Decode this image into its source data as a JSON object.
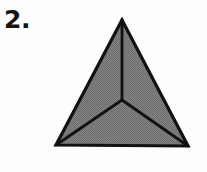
{
  "figure": {
    "label": "2.",
    "title": "",
    "background_color": "#fdfdfd",
    "shape_name": "equilateral-triangle-divided-into-three-parts",
    "fill_color": "#7a7a7a",
    "fill_texture": "halftone-dither-gray",
    "stroke_color": "#111111",
    "outline_stroke_width": 3.2,
    "divider_stroke_width": 2.8,
    "vertices": {
      "apex": {
        "x": 122,
        "y": 20
      },
      "bottom_left": {
        "x": 56,
        "y": 145
      },
      "bottom_right": {
        "x": 188,
        "y": 146
      },
      "centroid": {
        "x": 122,
        "y": 100
      }
    },
    "regions": [
      {
        "name": "left-region",
        "points": "122,20 56,145 122,100"
      },
      {
        "name": "right-region",
        "points": "122,20 122,100 188,146"
      },
      {
        "name": "bottom-region",
        "points": "56,145 188,146 122,100"
      }
    ],
    "dividers": [
      {
        "name": "divider-apex-to-center",
        "x1": 122,
        "y1": 20,
        "x2": 122,
        "y2": 100
      },
      {
        "name": "divider-center-to-bottom-left",
        "x1": 122,
        "y1": 100,
        "x2": 56,
        "y2": 145
      },
      {
        "name": "divider-center-to-bottom-right",
        "x1": 122,
        "y1": 100,
        "x2": 188,
        "y2": 146
      }
    ]
  }
}
